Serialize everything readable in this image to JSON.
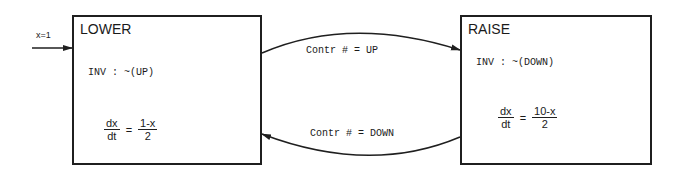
{
  "diagram": {
    "type": "hybrid-automaton",
    "initial": {
      "label": "x=1",
      "target": "LOWER"
    },
    "states": [
      {
        "name": "LOWER",
        "invariant": "INV : ~(UP)",
        "flow": {
          "lhs_num": "dx",
          "lhs_den": "dt",
          "rhs_num": "1-x",
          "rhs_den": "2",
          "sign": "="
        }
      },
      {
        "name": "RAISE",
        "invariant": "INV : ~(DOWN)",
        "flow": {
          "lhs_num": "dx",
          "lhs_den": "dt",
          "rhs_num": "10-x",
          "rhs_den": "2",
          "sign": "="
        }
      }
    ],
    "transitions": [
      {
        "from": "LOWER",
        "to": "RAISE",
        "label": "Contr # = UP"
      },
      {
        "from": "RAISE",
        "to": "LOWER",
        "label": "Contr # = DOWN"
      }
    ],
    "colors": {
      "line": "#1f1f1f",
      "background": "#ffffff"
    }
  }
}
